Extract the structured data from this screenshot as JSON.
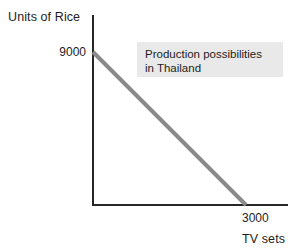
{
  "figure": {
    "background_color": "#ffffff",
    "axis_color": "#262626",
    "curve_color": "#8a8a8a",
    "annotation_bg_color": "#e9e9e9",
    "text_color": "#1d1d1d"
  },
  "axes": {
    "y_title": "Units of Rice",
    "x_title": "TV sets",
    "y_intercept_label": "9000",
    "x_intercept_label": "3000"
  },
  "annotation": {
    "line1": "Production possibilities",
    "line2": "in Thailand"
  },
  "chart_data": {
    "type": "line",
    "title": "",
    "subtitle": "",
    "xlabel": "TV sets",
    "ylabel": "Units of Rice",
    "xlim": [
      0,
      3600
    ],
    "ylim": [
      0,
      10400
    ],
    "grid": false,
    "legend": null,
    "xticks": [
      3000
    ],
    "xticklabels": [
      "3000"
    ],
    "yticks": [
      9000
    ],
    "yticklabels": [
      "9000"
    ],
    "series": [
      {
        "name": "Production possibilities in Thailand",
        "color": "#8a8a8a",
        "x": [
          0,
          3000
        ],
        "y": [
          9000,
          0
        ]
      }
    ],
    "annotations": [
      {
        "text": "Production possibilities in Thailand",
        "x": 800,
        "y": 8600
      }
    ]
  }
}
